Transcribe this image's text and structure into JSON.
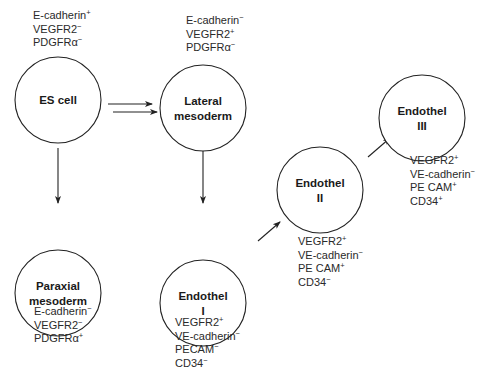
{
  "diagram": {
    "cells": [
      {
        "id": "es-cell",
        "lines": [
          "ES cell"
        ],
        "cx": 58,
        "cy": 100,
        "r": 43
      },
      {
        "id": "lateral-mesoderm",
        "lines": [
          "Lateral",
          "mesoderm"
        ],
        "cx": 203,
        "cy": 108,
        "r": 43
      },
      {
        "id": "paraxial-mesoderm",
        "lines": [
          "Paraxial",
          "mesoderm"
        ],
        "cx": 58,
        "cy": 293,
        "r": 43
      },
      {
        "id": "endothel-i",
        "lines": [
          "Endothel",
          "I"
        ],
        "cx": 203,
        "cy": 303,
        "r": 43
      },
      {
        "id": "endothel-ii",
        "lines": [
          "Endothel",
          "II"
        ],
        "cx": 320,
        "cy": 190,
        "r": 43
      },
      {
        "id": "endothel-iii",
        "lines": [
          "Endothel",
          "III"
        ],
        "cx": 422,
        "cy": 118,
        "r": 43
      }
    ],
    "marker_blocks": [
      {
        "for": "es-cell",
        "x": 33,
        "y": 19,
        "markers": [
          {
            "name": "E-cadherin",
            "sign": "+"
          },
          {
            "name": "VEGFR2",
            "sign": "−"
          },
          {
            "name": "PDGFRα",
            "sign": "−"
          }
        ]
      },
      {
        "for": "lateral-mesoderm",
        "x": 186,
        "y": 24,
        "markers": [
          {
            "name": "E-cadherin",
            "sign": "−"
          },
          {
            "name": "VEGFR2",
            "sign": "+"
          },
          {
            "name": "PDGFRα",
            "sign": "−"
          }
        ]
      },
      {
        "for": "paraxial-mesoderm",
        "x": 34,
        "y": 315,
        "markers": [
          {
            "name": "E-cadherin",
            "sign": "−"
          },
          {
            "name": "VEGFR2",
            "sign": "−"
          },
          {
            "name": "PDGFRα",
            "sign": "+"
          }
        ]
      },
      {
        "for": "endothel-i",
        "x": 175,
        "y": 326,
        "markers": [
          {
            "name": "VEGFR2",
            "sign": "+"
          },
          {
            "name": "VE-cadherin",
            "sign": "−"
          },
          {
            "name": "PECAM",
            "sign": "−"
          },
          {
            "name": "CD34",
            "sign": "−"
          }
        ]
      },
      {
        "for": "endothel-ii",
        "x": 298,
        "y": 245,
        "markers": [
          {
            "name": "VEGFR2",
            "sign": "+"
          },
          {
            "name": "VE-cadherin",
            "sign": "−"
          },
          {
            "name": "PE CAM",
            "sign": "+"
          },
          {
            "name": "CD34",
            "sign": "−"
          }
        ]
      },
      {
        "for": "endothel-iii",
        "x": 410,
        "y": 164,
        "markers": [
          {
            "name": "VEGFR2",
            "sign": "+"
          },
          {
            "name": "VE-cadherin",
            "sign": "−"
          },
          {
            "name": "PE CAM",
            "sign": "+"
          },
          {
            "name": "CD34",
            "sign": "+"
          }
        ]
      }
    ],
    "arrows": [
      {
        "id": "es-to-lateral-1",
        "x1": 108,
        "y1": 104,
        "x2": 152,
        "y2": 104
      },
      {
        "id": "es-to-lateral-2",
        "x1": 113,
        "y1": 112,
        "x2": 157,
        "y2": 112
      },
      {
        "id": "es-to-paraxial",
        "x1": 58,
        "y1": 148,
        "x2": 58,
        "y2": 203
      },
      {
        "id": "lateral-to-endothel-i",
        "x1": 203,
        "y1": 148,
        "x2": 203,
        "y2": 203
      },
      {
        "id": "endothel-i-to-ii",
        "x1": 258,
        "y1": 241,
        "x2": 280,
        "y2": 222
      },
      {
        "id": "endothel-ii-to-iii",
        "x1": 368,
        "y1": 157,
        "x2": 390,
        "y2": 138
      }
    ]
  }
}
